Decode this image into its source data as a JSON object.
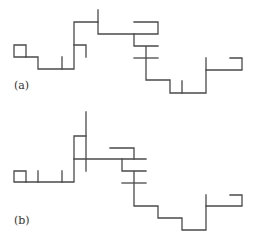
{
  "figures": [
    {
      "id": "a",
      "label": "(a)",
      "description": "Lattice walk with dangling branches (variant a)"
    },
    {
      "id": "b",
      "label": "(b)",
      "description": "Lattice walk with dangling branches (variant b)"
    }
  ],
  "colors": {
    "line": "#4a4a4a",
    "background": "#ffffff"
  }
}
